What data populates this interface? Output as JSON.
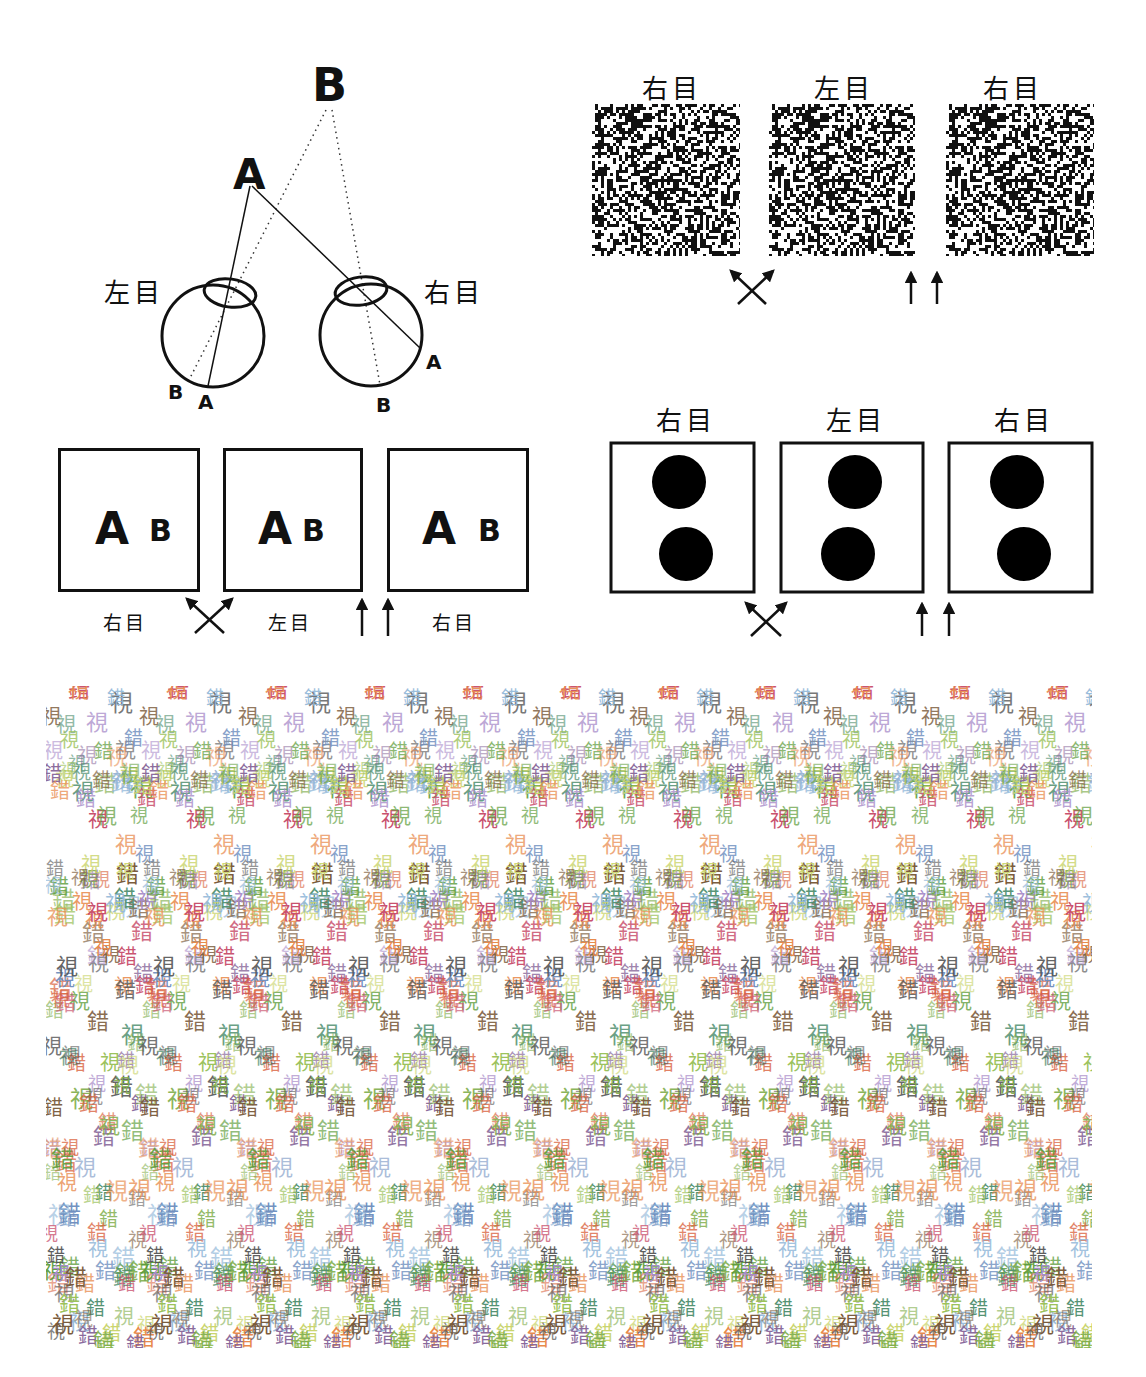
{
  "eye_labels": {
    "left_eye": "左目",
    "right_eye": "右目"
  },
  "geometry_diagram": {
    "far_object": "B",
    "near_object": "A",
    "left_eye_label": "左目",
    "right_eye_label": "右目",
    "left_retina_labels": [
      "B",
      "A"
    ],
    "right_retina_labels": [
      "A",
      "B"
    ]
  },
  "ab_panels": {
    "panels": [
      {
        "near": "A",
        "far": "B",
        "caption": "右目"
      },
      {
        "near": "A",
        "far": "B",
        "caption": "左目"
      },
      {
        "near": "A",
        "far": "B",
        "caption": "右目"
      }
    ]
  },
  "random_dot_panels": {
    "headers": [
      "右目",
      "左目",
      "右目"
    ]
  },
  "dot_panels": {
    "headers": [
      "右目",
      "左目",
      "右目"
    ]
  },
  "viewing_methods": [
    {
      "name": "cross-eyed",
      "icon": "crossed-arrows-icon"
    },
    {
      "name": "parallel",
      "icon": "parallel-arrows-icon"
    }
  ],
  "stereogram": {
    "glyphs": [
      "視",
      "錯"
    ],
    "colors": [
      "#d9603b",
      "#e8894a",
      "#7fae4b",
      "#5c9c3a",
      "#9bc25a",
      "#c9d46b",
      "#6f8fbf",
      "#8fb6d8",
      "#8a6a9c",
      "#555555",
      "#7a5a3a",
      "#c94f6d",
      "#4f8f6f",
      "#a88bc9"
    ]
  }
}
